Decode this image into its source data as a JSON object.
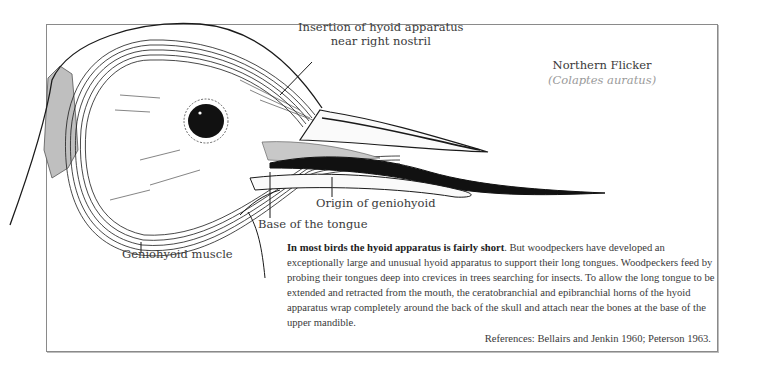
{
  "species": {
    "common_name": "Northern Flicker",
    "scientific_name": "(Colaptes auratus)"
  },
  "labels": {
    "insertion_line1": "Insertion of hyoid apparatus",
    "insertion_line2": "near right nostril",
    "origin_geniohyoid": "Origin of geniohyoid",
    "base_tongue": "Base of the tongue",
    "geniohyoid_muscle": "Geniohyoid muscle"
  },
  "caption": {
    "lead_bold": "In most birds the hyoid apparatus is fairly short",
    "body": ". But woodpeckers have developed an exceptionally large and unusual hyoid apparatus to support their long tongues. Woodpeckers feed by probing their tongues deep into crevices in trees searching for insects. To allow the long tongue to be extended and retracted from the mouth, the ceratobranchial and epibranchial horns of the hyoid apparatus wrap completely around the back of the skull and attach near the bones at the base of the upper mandible."
  },
  "references": "References: Bellairs and Jenkin 1960; Peterson 1963.",
  "colors": {
    "frame_border": "#8a8a8a",
    "ink": "#1a1a1a",
    "text": "#3a3a3a",
    "shading": "#bdbdbd"
  }
}
